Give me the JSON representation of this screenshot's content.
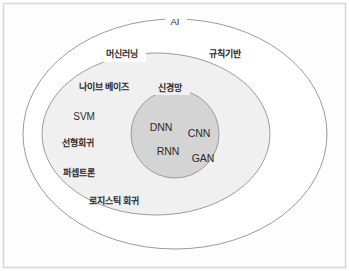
{
  "figure": {
    "kind": "nested-venn-diagram",
    "frame": {
      "border_color": "#d9d9d9",
      "background": "#fdfdfd"
    },
    "colors": {
      "outer_fill": "#ffffff",
      "outer_stroke": "#9a9a9a",
      "middle_fill": "#f0f0f0",
      "middle_stroke": "#9a9a9a",
      "inner_fill": "#d4d4d4",
      "inner_stroke": "#9a9a9a",
      "text": "#2b2b2b"
    },
    "levels": [
      {
        "name": "outer",
        "label": "AI",
        "shape": "ellipse",
        "cx": 175,
        "cy": 134,
        "rx": 152,
        "ry": 115
      },
      {
        "name": "middle",
        "label": "머신러닝",
        "shape": "ellipse",
        "cx": 156,
        "cy": 134,
        "rx": 114,
        "ry": 81
      },
      {
        "name": "inner",
        "label": "신경망",
        "shape": "circle",
        "cx": 175,
        "cy": 134,
        "r": 44
      }
    ],
    "labels": {
      "ai": "AI",
      "machine_learning": "머신러닝",
      "rule_based": "규칙기반",
      "neural_network": "신경망"
    },
    "machine_learning_items": [
      {
        "text": "나이브 베이즈",
        "x": 104,
        "y": 87,
        "script": "ko"
      },
      {
        "text": "SVM",
        "x": 84,
        "y": 117,
        "script": "en"
      },
      {
        "text": "선형회귀",
        "x": 78,
        "y": 143,
        "script": "ko"
      },
      {
        "text": "퍼셉트론",
        "x": 79,
        "y": 173,
        "script": "ko"
      },
      {
        "text": "로지스틱 회귀",
        "x": 114,
        "y": 201,
        "script": "ko"
      }
    ],
    "neural_network_items": [
      {
        "text": "DNN",
        "x": 161,
        "y": 127
      },
      {
        "text": "CNN",
        "x": 199,
        "y": 133
      },
      {
        "text": "RNN",
        "x": 168,
        "y": 151
      },
      {
        "text": "GAN",
        "x": 203,
        "y": 158
      }
    ],
    "outer_only_items": [
      {
        "text": "규칙기반",
        "x": 225,
        "y": 54,
        "script": "ko"
      }
    ],
    "boundary_labels": [
      {
        "text": "AI",
        "x": 175,
        "y": 22,
        "on": "outer"
      },
      {
        "text": "머신러닝",
        "x": 122,
        "y": 54,
        "on": "middle"
      },
      {
        "text": "신경망",
        "x": 170,
        "y": 88,
        "on": "inner"
      }
    ]
  }
}
